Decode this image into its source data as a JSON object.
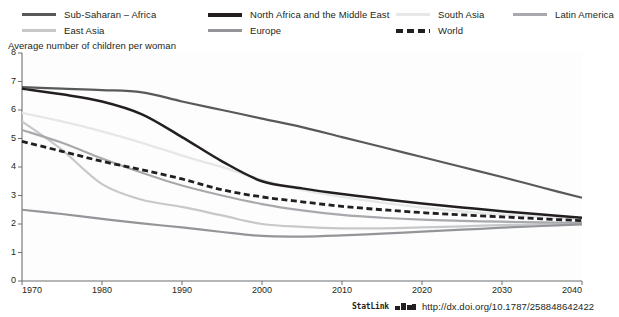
{
  "legend": {
    "items": [
      {
        "label": "Sub-Saharan – Africa",
        "color": "#58595b",
        "style": "solid",
        "width": 3.4,
        "col": 0,
        "row": 0
      },
      {
        "label": "East Asia",
        "color": "#c7c8ca",
        "style": "solid",
        "width": 3.0,
        "col": 0,
        "row": 1
      },
      {
        "label": "North Africa and the Middle East",
        "color": "#231f20",
        "style": "solid",
        "width": 4.0,
        "col": 1,
        "row": 0
      },
      {
        "label": "Europe",
        "color": "#939598",
        "style": "solid",
        "width": 3.0,
        "col": 1,
        "row": 1
      },
      {
        "label": "South Asia",
        "color": "#e6e7e8",
        "style": "solid",
        "width": 3.0,
        "col": 2,
        "row": 0
      },
      {
        "label": "World",
        "color": "#231f20",
        "style": "dashed",
        "width": 4.0,
        "col": 2,
        "row": 1
      },
      {
        "label": "Latin America",
        "color": "#a7a9ac",
        "style": "solid",
        "width": 3.0,
        "col": 3,
        "row": 0
      }
    ]
  },
  "axis_title": "Average number of children per woman",
  "statlink": {
    "word": "StatLink",
    "url": "http://dx.doi.org/10.1787/258848642422",
    "glyph_name": "statlink-barcode-icon"
  },
  "chart_data": {
    "type": "line",
    "title": "",
    "subtitle": "",
    "xlabel": "",
    "ylabel": "Average number of children per woman",
    "xlim": [
      1970,
      2040
    ],
    "ylim": [
      0,
      8
    ],
    "yticks": [
      0,
      1,
      2,
      3,
      4,
      5,
      6,
      7,
      8
    ],
    "xticks": [
      1970,
      1980,
      1990,
      2000,
      2010,
      2020,
      2030,
      2040
    ],
    "grid": false,
    "legend_position": "top",
    "x": [
      1970,
      1975,
      1980,
      1985,
      1990,
      1995,
      2000,
      2005,
      2010,
      2015,
      2020,
      2025,
      2030,
      2035,
      2040
    ],
    "series": [
      {
        "name": "Sub-Saharan – Africa",
        "color": "#58595b",
        "style": "solid",
        "width": 2.2,
        "values": [
          6.8,
          6.75,
          6.7,
          6.62,
          6.3,
          6.0,
          5.7,
          5.4,
          5.05,
          4.7,
          4.35,
          4.0,
          3.65,
          3.28,
          2.92
        ]
      },
      {
        "name": "North Africa and the Middle East",
        "color": "#231f20",
        "style": "solid",
        "width": 2.5,
        "values": [
          6.75,
          6.55,
          6.3,
          5.85,
          5.05,
          4.2,
          3.5,
          3.25,
          3.05,
          2.88,
          2.72,
          2.58,
          2.45,
          2.33,
          2.22
        ]
      },
      {
        "name": "South Asia",
        "color": "#e6e7e8",
        "style": "solid",
        "width": 2.4,
        "values": [
          5.9,
          5.6,
          5.25,
          4.85,
          4.4,
          4.0,
          3.55,
          3.2,
          2.95,
          2.75,
          2.58,
          2.44,
          2.33,
          2.24,
          2.16
        ]
      },
      {
        "name": "East Asia",
        "color": "#c7c8ca",
        "style": "solid",
        "width": 2.2,
        "values": [
          5.6,
          4.6,
          3.4,
          2.85,
          2.6,
          2.3,
          2.0,
          1.9,
          1.85,
          1.85,
          1.88,
          1.92,
          1.96,
          2.0,
          2.04
        ]
      },
      {
        "name": "World",
        "color": "#231f20",
        "style": "dashed",
        "width": 2.8,
        "values": [
          4.9,
          4.55,
          4.2,
          3.9,
          3.58,
          3.2,
          2.95,
          2.78,
          2.62,
          2.5,
          2.4,
          2.32,
          2.25,
          2.18,
          2.12
        ]
      },
      {
        "name": "Europe",
        "color": "#939598",
        "style": "solid",
        "width": 2.2,
        "values": [
          2.5,
          2.35,
          2.18,
          2.02,
          1.88,
          1.72,
          1.58,
          1.56,
          1.6,
          1.66,
          1.73,
          1.8,
          1.87,
          1.93,
          1.99
        ]
      },
      {
        "name": "Latin America",
        "color": "#a7a9ac",
        "style": "solid",
        "width": 2.2,
        "values": [
          5.3,
          4.85,
          4.3,
          3.8,
          3.35,
          3.0,
          2.7,
          2.48,
          2.32,
          2.22,
          2.15,
          2.11,
          2.08,
          2.06,
          2.04
        ]
      }
    ]
  }
}
